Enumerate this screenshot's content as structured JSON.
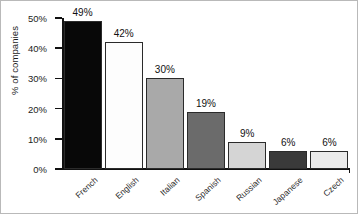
{
  "chart_data": {
    "type": "bar",
    "title": "",
    "xlabel": "",
    "ylabel": "% of companies",
    "ylim": [
      0,
      50
    ],
    "grid": false,
    "legend": null,
    "categories": [
      "French",
      "English",
      "Italian",
      "Spanish",
      "Russian",
      "Japanese",
      "Czech"
    ],
    "values": [
      49,
      42,
      30,
      19,
      9,
      6,
      6
    ],
    "value_labels": [
      "49%",
      "42%",
      "30%",
      "19%",
      "9%",
      "6%",
      "6%"
    ],
    "bar_colors": [
      "#080808",
      "#fdfdfd",
      "#a9a9a9",
      "#6b6b6b",
      "#d5d5d5",
      "#3a3a3a",
      "#ebebeb"
    ],
    "bar_border_color": "#2b2b2b",
    "y_ticks": [
      0,
      10,
      20,
      30,
      40,
      50
    ],
    "y_tick_labels": [
      "0%",
      "10%",
      "20%",
      "30%",
      "40%",
      "50%"
    ],
    "axis_color": "#111111",
    "background_color": "#ffffff",
    "border_color": "#b9b9b9"
  }
}
